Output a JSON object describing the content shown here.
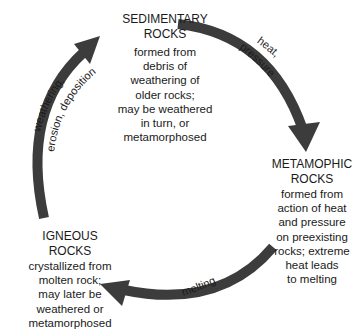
{
  "diagram": {
    "type": "cycle",
    "arrow_color": "#3c3c3c",
    "nodes": [
      {
        "id": "sedimentary",
        "title_line1": "SEDIMENTARY",
        "title_line2": "ROCKS",
        "desc_lines": [
          "formed from",
          "debris of",
          "weathering of",
          "older rocks;",
          "may be weathered",
          "in turn, or",
          "metamorphosed"
        ]
      },
      {
        "id": "metamorphic",
        "title_line1": "METAMOPHIC",
        "title_line2": "ROCKS",
        "desc_lines": [
          "formed from",
          "action of heat",
          "and pressure",
          "on preexisting",
          "rocks; extreme",
          "heat leads",
          "to melting"
        ]
      },
      {
        "id": "igneous",
        "title_line1": "IGNEOUS",
        "title_line2": "ROCKS",
        "desc_lines": [
          "crystallized from",
          "molten rock;",
          "may later be",
          "weathered or",
          "metamorphosed"
        ]
      }
    ],
    "edges": [
      {
        "from": "sedimentary",
        "to": "metamorphic",
        "label_line1": "heat,",
        "label_line2": "pressure"
      },
      {
        "from": "metamorphic",
        "to": "igneous",
        "label_line1": "melting"
      },
      {
        "from": "igneous",
        "to": "sedimentary",
        "label_line1": "weathering,",
        "label_line2": "erosion, deposition"
      }
    ]
  }
}
